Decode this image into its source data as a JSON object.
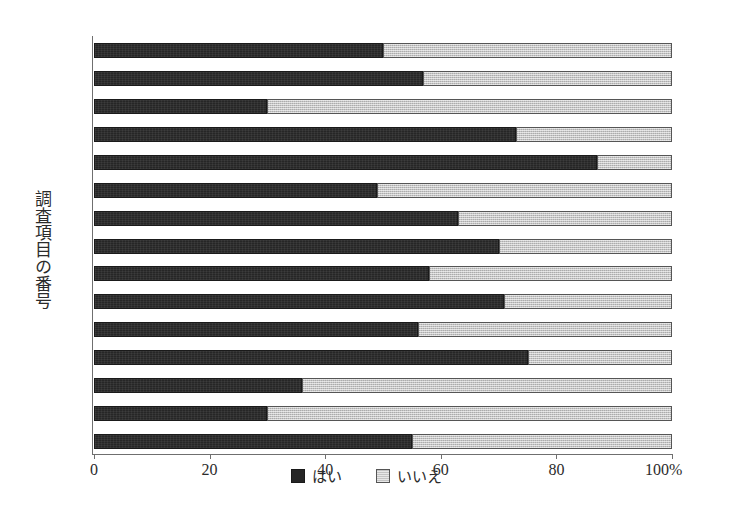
{
  "chart_data": {
    "type": "bar",
    "orientation": "horizontal",
    "stacked": true,
    "normalized_percent": true,
    "title": "",
    "xlabel": "",
    "ylabel": "調査項目の番号",
    "xlim": [
      0,
      100
    ],
    "grid": false,
    "legend_position": "bottom-center",
    "x_unit_suffix": "%",
    "categories": [
      "1",
      "2",
      "3",
      "4",
      "5",
      "6",
      "7",
      "8",
      "9",
      "10",
      "11",
      "12",
      "13",
      "14",
      "15"
    ],
    "xticks": [
      0,
      20,
      40,
      60,
      80,
      100
    ],
    "xticklabels": [
      "0",
      "20",
      "40",
      "60",
      "80",
      "100%"
    ],
    "series": [
      {
        "name": "はい",
        "color": "#262626",
        "values": [
          50,
          57,
          30,
          73,
          87,
          49,
          63,
          70,
          58,
          71,
          56,
          75,
          36,
          30,
          55
        ]
      },
      {
        "name": "いいえ",
        "color": "#cfcfcf",
        "values": [
          50,
          43,
          70,
          27,
          13,
          51,
          37,
          30,
          42,
          29,
          44,
          25,
          64,
          70,
          45
        ]
      }
    ]
  },
  "legend": {
    "items": [
      {
        "label": "はい",
        "swatch": "black-swatch"
      },
      {
        "label": "いいえ",
        "swatch": "gray-swatch"
      }
    ]
  }
}
